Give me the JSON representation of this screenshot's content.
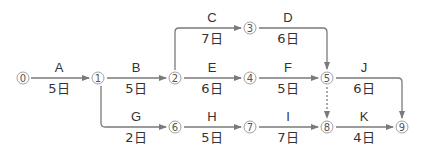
{
  "diagram": {
    "type": "arrow-diagram",
    "colors": {
      "line": "#7a7a7a",
      "text": "#333333",
      "node": "#666666"
    },
    "nodes": [
      {
        "id": "0",
        "label": "⓪",
        "x": 23,
        "y": 78
      },
      {
        "id": "1",
        "label": "①",
        "x": 98,
        "y": 78
      },
      {
        "id": "2",
        "label": "②",
        "x": 175,
        "y": 78
      },
      {
        "id": "3",
        "label": "③",
        "x": 250,
        "y": 28
      },
      {
        "id": "4",
        "label": "④",
        "x": 250,
        "y": 78
      },
      {
        "id": "5",
        "label": "⑤",
        "x": 327,
        "y": 78
      },
      {
        "id": "6",
        "label": "⑥",
        "x": 175,
        "y": 127
      },
      {
        "id": "7",
        "label": "⑦",
        "x": 250,
        "y": 127
      },
      {
        "id": "8",
        "label": "⑧",
        "x": 327,
        "y": 127
      },
      {
        "id": "9",
        "label": "⑨",
        "x": 402,
        "y": 127
      }
    ],
    "activities": [
      {
        "name": "A",
        "duration": "5日",
        "from": "0",
        "to": "1"
      },
      {
        "name": "B",
        "duration": "5日",
        "from": "1",
        "to": "2"
      },
      {
        "name": "C",
        "duration": "7日",
        "from": "2",
        "to": "3"
      },
      {
        "name": "D",
        "duration": "6日",
        "from": "3",
        "to": "5"
      },
      {
        "name": "E",
        "duration": "6日",
        "from": "2",
        "to": "4"
      },
      {
        "name": "F",
        "duration": "5日",
        "from": "4",
        "to": "5"
      },
      {
        "name": "G",
        "duration": "2日",
        "from": "1",
        "to": "6"
      },
      {
        "name": "H",
        "duration": "5日",
        "from": "6",
        "to": "7"
      },
      {
        "name": "I",
        "duration": "7日",
        "from": "7",
        "to": "8"
      },
      {
        "name": "J",
        "duration": "6日",
        "from": "5",
        "to": "9"
      },
      {
        "name": "K",
        "duration": "4日",
        "from": "8",
        "to": "9"
      }
    ],
    "dummy": {
      "from": "5",
      "to": "8",
      "style": "dashed"
    }
  }
}
